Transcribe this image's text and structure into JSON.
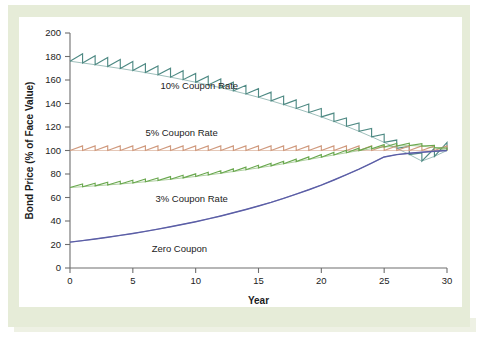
{
  "figure": {
    "background_color": "#e6ecd8",
    "plate_color": "#ffffff"
  },
  "chart_data": {
    "type": "line",
    "title": "",
    "xlabel": "Year",
    "ylabel": "Bond Price (% of Face Value)",
    "xlim": [
      0,
      30
    ],
    "ylim": [
      0,
      200
    ],
    "xticks": [
      0,
      5,
      10,
      15,
      20,
      25,
      30
    ],
    "xtick_labels": [
      "0",
      "5",
      "10",
      "15",
      "20",
      "25",
      "30"
    ],
    "yticks": [
      0,
      20,
      40,
      60,
      80,
      100,
      120,
      140,
      160,
      180,
      200
    ],
    "ytick_labels": [
      "0",
      "20",
      "40",
      "60",
      "80",
      "100",
      "120",
      "140",
      "160",
      "180",
      "200"
    ],
    "grid": false,
    "legend_position": "inline-annotations",
    "note": "Bond prices converge to 100% of face value at maturity (year 30). Sawtooth teeth are accrued-coupon jumps; coupons paid annually at 6% yield.",
    "yield_to_maturity": 6,
    "maturity_years": 30,
    "par_value": 100,
    "series": [
      {
        "name": "10% Coupon Rate",
        "color": "#4f8a84",
        "coupon_rate": 10,
        "sawtooth": true,
        "label_x": 7.2,
        "label_y": 152,
        "x": [
          0,
          1,
          2,
          3,
          4,
          5,
          6,
          7,
          8,
          9,
          10,
          11,
          12,
          13,
          14,
          15,
          16,
          17,
          18,
          19,
          20,
          21,
          22,
          23,
          24,
          25,
          26,
          27,
          28,
          29,
          30
        ],
        "values": [
          155.1,
          154.4,
          153.6,
          152.8,
          152.0,
          151.1,
          150.2,
          149.2,
          148.1,
          147.0,
          145.8,
          144.6,
          143.3,
          141.9,
          140.4,
          138.8,
          137.1,
          135.3,
          133.4,
          131.4,
          129.3,
          127.1,
          124.7,
          122.2,
          119.5,
          116.7,
          113.7,
          110.5,
          107.1,
          103.5,
          100.0
        ],
        "drawn_baseline": [
          176,
          174.5,
          173,
          171.4,
          169.8,
          168.1,
          166.3,
          164.4,
          162.4,
          160.3,
          158.1,
          155.8,
          153.4,
          150.8,
          148.1,
          145.3,
          142.3,
          139.1,
          135.8,
          132.3,
          128.6,
          124.7,
          120.6,
          116.3,
          111.7,
          106.9,
          101.9,
          96.6,
          91.0,
          95.0,
          100.0
        ]
      },
      {
        "name": "5% Coupon Rate",
        "color": "#d09a7e",
        "coupon_rate": 5,
        "sawtooth": true,
        "label_x": 6.0,
        "label_y": 112,
        "x": [
          0,
          5,
          10,
          15,
          20,
          25,
          30
        ],
        "values": [
          100,
          100,
          100,
          100,
          100,
          100,
          100
        ],
        "drawn_baseline": [
          100,
          100,
          100,
          100,
          100,
          100,
          100
        ]
      },
      {
        "name": "3% Coupon Rate",
        "color": "#6aa84f",
        "coupon_rate": 3,
        "sawtooth": true,
        "label_x": 6.8,
        "label_y": 56,
        "x": [
          0,
          1,
          2,
          3,
          4,
          5,
          6,
          7,
          8,
          9,
          10,
          11,
          12,
          13,
          14,
          15,
          16,
          17,
          18,
          19,
          20,
          21,
          22,
          23,
          24,
          25,
          26,
          27,
          28,
          29,
          30
        ],
        "values": [
          68.5,
          69.3,
          70.1,
          70.9,
          71.8,
          72.7,
          73.6,
          74.6,
          75.7,
          76.8,
          77.9,
          79.1,
          80.4,
          81.7,
          83.1,
          84.6,
          86.1,
          87.7,
          89.4,
          91.2,
          93.1,
          95.1,
          97.2,
          99.4,
          101.7,
          104.1,
          106.7,
          109.4,
          112.2,
          115.2,
          100.0
        ],
        "drawn_baseline": [
          68.5,
          69.2,
          69.9,
          70.7,
          71.5,
          72.4,
          73.4,
          74.4,
          75.5,
          76.7,
          77.9,
          79.2,
          80.6,
          82.1,
          83.6,
          85.2,
          86.9,
          88.7,
          90.5,
          92.4,
          94.3,
          96.2,
          98.1,
          99.9,
          101.5,
          102.9,
          103.8,
          104.2,
          103.8,
          102.4,
          100.0
        ]
      },
      {
        "name": "Zero Coupon",
        "color": "#5b5ea6",
        "coupon_rate": 0,
        "sawtooth": false,
        "label_x": 6.5,
        "label_y": 14,
        "x": [
          0,
          1,
          2,
          3,
          4,
          5,
          6,
          7,
          8,
          9,
          10,
          11,
          12,
          13,
          14,
          15,
          16,
          17,
          18,
          19,
          20,
          21,
          22,
          23,
          24,
          25,
          26,
          27,
          28,
          29,
          30
        ],
        "values": [
          22.0,
          23.3,
          24.7,
          26.2,
          27.8,
          29.4,
          31.2,
          33.1,
          35.1,
          37.1,
          39.4,
          41.7,
          44.2,
          46.9,
          49.7,
          52.7,
          55.8,
          59.2,
          62.7,
          66.5,
          70.5,
          74.7,
          79.2,
          83.9,
          88.9,
          94.3,
          100.0,
          100.0,
          100.0,
          100.0,
          100.0
        ],
        "drawn_baseline": [
          22.0,
          23.3,
          24.7,
          26.2,
          27.8,
          29.4,
          31.2,
          33.1,
          35.1,
          37.2,
          39.4,
          41.8,
          44.3,
          47.0,
          49.8,
          52.8,
          55.9,
          59.3,
          62.9,
          66.6,
          70.6,
          74.9,
          79.4,
          84.1,
          89.2,
          94.5,
          96.5,
          97.6,
          98.5,
          99.3,
          100.0
        ]
      }
    ]
  }
}
